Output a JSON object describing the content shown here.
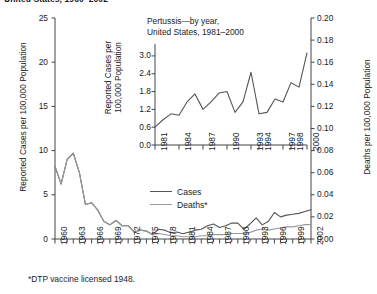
{
  "main_title": "United States, 1960–2002",
  "footnote": "*DTP vaccine licensed 1948.",
  "legend": {
    "cases": "Cases",
    "deaths": "Deaths*"
  },
  "colors": {
    "cases": "#555555",
    "deaths": "#9a9a9a",
    "axis": "#444444"
  },
  "left_axis_title": "Reported Cases per 100,000 Population",
  "right_axis_title": "Deaths per 100,000 Population",
  "inset_title_line1": "Pertussis—by year,",
  "inset_title_line2": "United States, 1981–2000",
  "inset_axis_title_line1": "Reported Cases per",
  "inset_axis_title_line2": "100,000 Population",
  "chart_data": [
    {
      "type": "line",
      "id": "main",
      "title": "Pertussis (Whooping Cough) — United States, 1960–2002",
      "xlabel": "",
      "ylabel": "Reported Cases per 100,000 Population",
      "ylabel_right": "Deaths per 100,000 Population",
      "xlim": [
        1960,
        2002
      ],
      "ylim": [
        0,
        25
      ],
      "ylim_right": [
        0.0,
        0.2
      ],
      "yticks": [
        0,
        5,
        10,
        15,
        20,
        25
      ],
      "yticks_right": [
        "0.00",
        "0.02",
        "0.04",
        "0.06",
        "0.08",
        "0.10",
        "0.12",
        "0.14",
        "0.16",
        "0.18",
        "0.20"
      ],
      "xticks": [
        1960,
        1963,
        1966,
        1969,
        1972,
        1975,
        1978,
        1981,
        1984,
        1987,
        1990,
        1993,
        1996,
        1999,
        2002
      ],
      "grid": false,
      "legend_position": "center",
      "x": [
        1960,
        1961,
        1962,
        1963,
        1964,
        1965,
        1966,
        1967,
        1968,
        1969,
        1970,
        1971,
        1972,
        1973,
        1974,
        1975,
        1976,
        1977,
        1978,
        1979,
        1980,
        1981,
        1982,
        1983,
        1984,
        1985,
        1986,
        1987,
        1988,
        1989,
        1990,
        1991,
        1992,
        1993,
        1994,
        1995,
        1996,
        1997,
        1998,
        1999,
        2000,
        2001,
        2002
      ],
      "series": [
        {
          "name": "Cases",
          "axis": "left",
          "values": [
            8.2,
            6.2,
            9.0,
            9.7,
            7.5,
            3.9,
            4.1,
            3.3,
            2.0,
            1.6,
            2.1,
            1.5,
            1.5,
            0.8,
            1.0,
            0.9,
            0.5,
            1.1,
            1.0,
            0.7,
            0.8,
            0.6,
            0.8,
            1.0,
            1.1,
            1.5,
            1.7,
            1.3,
            1.5,
            1.8,
            1.8,
            1.1,
            1.7,
            2.4,
            1.6,
            2.0,
            3.0,
            2.5,
            2.7,
            2.8,
            2.9,
            3.1,
            3.3
          ]
        },
        {
          "name": "Deaths*",
          "axis": "right",
          "values": [
            0.066,
            0.05,
            0.072,
            0.078,
            0.06,
            0.031,
            0.033,
            0.026,
            0.016,
            0.013,
            0.017,
            0.012,
            0.012,
            0.006,
            0.008,
            0.007,
            0.004,
            0.005,
            0.004,
            0.003,
            0.003,
            0.002,
            0.002,
            0.002,
            0.003,
            0.003,
            0.004,
            0.004,
            0.004,
            0.005,
            0.005,
            0.005,
            0.006,
            0.008,
            0.009,
            0.008,
            0.009,
            0.01,
            0.011,
            0.011,
            0.012,
            0.013,
            0.013
          ]
        }
      ]
    },
    {
      "type": "line",
      "id": "inset",
      "title": "Pertussis—by year, United States, 1981–2000",
      "xlabel": "",
      "ylabel": "Reported Cases per 100,000 Population",
      "xlim": [
        1981,
        2000
      ],
      "ylim": [
        0.0,
        3.2
      ],
      "yticks": [
        "0.0",
        "0.6",
        "1.2",
        "1.8",
        "2.4",
        "3.0"
      ],
      "xticks": [
        1981,
        1984,
        1987,
        1990,
        1993,
        1994,
        1997,
        1998,
        2000
      ],
      "grid": false,
      "x": [
        1981,
        1982,
        1983,
        1984,
        1985,
        1986,
        1987,
        1988,
        1989,
        1990,
        1991,
        1992,
        1993,
        1994,
        1995,
        1996,
        1997,
        1998,
        1999,
        2000
      ],
      "series": [
        {
          "name": "Reported cases",
          "values": [
            0.6,
            0.85,
            1.05,
            1.0,
            1.45,
            1.72,
            1.2,
            1.45,
            1.75,
            1.8,
            1.1,
            1.45,
            2.45,
            1.05,
            1.1,
            1.55,
            1.45,
            2.1,
            1.95,
            3.1
          ]
        }
      ]
    }
  ]
}
